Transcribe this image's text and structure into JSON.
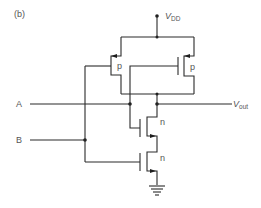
{
  "figure": {
    "panel_label": "(b)",
    "supply": {
      "label_main": "V",
      "label_sub": "DD"
    },
    "output": {
      "label_main": "V",
      "label_sub": "out"
    },
    "inputs": [
      {
        "name": "A"
      },
      {
        "name": "B"
      }
    ],
    "transistors": [
      {
        "id": "p-left",
        "type": "p",
        "label": "p"
      },
      {
        "id": "p-right",
        "type": "p",
        "label": "p"
      },
      {
        "id": "n-top",
        "type": "n",
        "label": "n"
      },
      {
        "id": "n-bottom",
        "type": "n",
        "label": "n"
      }
    ],
    "ground": {
      "symbol": "ground-icon"
    }
  }
}
